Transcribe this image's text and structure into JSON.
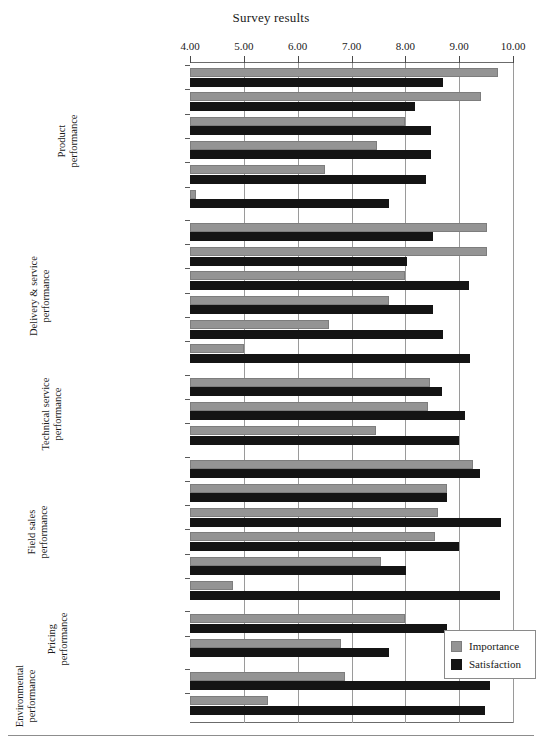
{
  "chart_data": {
    "type": "bar",
    "orientation": "horizontal",
    "title": "Survey results",
    "xlabel": "",
    "ylabel": "",
    "xlim": [
      4.0,
      10.0
    ],
    "xticks": [
      "4.00",
      "5.00",
      "6.00",
      "7.00",
      "8.00",
      "9.00",
      "10.00"
    ],
    "grid": true,
    "legend_position": "bottom-right",
    "series": [
      {
        "name": "Importance",
        "color": "#949494"
      },
      {
        "name": "Satisfaction",
        "color": "#141414"
      }
    ],
    "groups": [
      {
        "label": "Product\nperformance",
        "categories": [
          {
            "label": "Product performance",
            "importance": 9.73,
            "satisfaction": 8.7
          },
          {
            "label": "Product quality",
            "importance": 9.4,
            "satisfaction": 8.18
          },
          {
            "label": "Quality systems",
            "importance": 8.0,
            "satisfaction": 8.48
          },
          {
            "label": "Hygiene",
            "importance": 7.48,
            "satisfaction": 8.48
          },
          {
            "label": "Documentation",
            "importance": 6.5,
            "satisfaction": 8.38
          },
          {
            "label": "Product range",
            "importance": 4.12,
            "satisfaction": 7.7
          }
        ]
      },
      {
        "label": "Delivery & service\nperformance",
        "categories": [
          {
            "label": "Reliability of delivery",
            "importance": 9.52,
            "satisfaction": 8.52
          },
          {
            "label": "Feedback",
            "importance": 9.52,
            "satisfaction": 8.03
          },
          {
            "label": "Speed of delivery",
            "importance": 8.0,
            "satisfaction": 9.18
          },
          {
            "label": "Continuity of supply",
            "importance": 7.7,
            "satisfaction": 8.52
          },
          {
            "label": "Packaging",
            "importance": 6.58,
            "satisfaction": 8.7
          },
          {
            "label": "Ease of ordering",
            "importance": 5.0,
            "satisfaction": 9.2
          }
        ]
      },
      {
        "label": "Technical service\nperformance",
        "categories": [
          {
            "label": "Design Expertise",
            "importance": 8.46,
            "satisfaction": 8.68
          },
          {
            "label": "Technical service",
            "importance": 8.42,
            "satisfaction": 9.11
          },
          {
            "label": "Ability to innovate",
            "importance": 7.46,
            "satisfaction": 9.0
          }
        ]
      },
      {
        "label": "Field sales\nperformance",
        "categories": [
          {
            "label": "Accessibility",
            "importance": 9.25,
            "satisfaction": 9.38
          },
          {
            "label": "Empowerment",
            "importance": 8.78,
            "satisfaction": 8.78
          },
          {
            "label": "Interpersonal skills",
            "importance": 8.6,
            "satisfaction": 9.78
          },
          {
            "label": "Commercial capability",
            "importance": 8.55,
            "satisfaction": 9.0
          },
          {
            "label": "Technical capability",
            "importance": 7.55,
            "satisfaction": 8.02
          },
          {
            "label": "Frequency of calls",
            "importance": 4.8,
            "satisfaction": 9.76
          }
        ]
      },
      {
        "label": "Pricing\nperformance",
        "categories": [
          {
            "label": "Price competitiveness",
            "importance": 8.0,
            "satisfaction": 8.78
          },
          {
            "label": "Price negotiations",
            "importance": 6.8,
            "satisfaction": 7.7
          }
        ]
      },
      {
        "label": "Environmental\nperformance",
        "categories": [
          {
            "label": "Environmental responsibility",
            "importance": 6.88,
            "satisfaction": 9.58
          },
          {
            "label": "Recycling capability",
            "importance": 5.45,
            "satisfaction": 9.48
          }
        ]
      }
    ]
  },
  "legend": {
    "items": [
      {
        "label": "Importance"
      },
      {
        "label": "Satisfaction"
      }
    ]
  }
}
